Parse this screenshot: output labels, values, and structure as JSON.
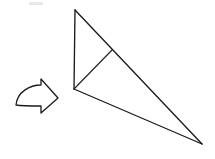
{
  "figure": {
    "background_color": "#ffffff",
    "stroke_color": "#1b1b1b",
    "caption": ""
  },
  "arrow": {
    "label": "fold-direction-arrow",
    "direction": "right",
    "style": "curved outline arrow",
    "fill_color": "#ffffff",
    "outline_color": "#1b1b1b",
    "tip_x": 58,
    "tip_y": 98,
    "path": "M 16 105 C 17 92, 30 85, 41 85 L 41 79 L 58 98 L 41 113 L 41 106 C 31 106, 22 106, 16 105 Z"
  },
  "shape": {
    "label": "folded-paper-triangle",
    "vertices": {
      "apex_top": {
        "x": 75,
        "y": 10
      },
      "left_corner": {
        "x": 74,
        "y": 89
      },
      "right_corner": {
        "x": 202,
        "y": 144
      },
      "crease_junction": {
        "x": 112,
        "y": 50
      }
    },
    "edges": [
      {
        "name": "left-vertical-edge",
        "from": "apex_top",
        "to": "left_corner",
        "path": "M 75 10 L 74 89"
      },
      {
        "name": "upper-hypotenuse-edge",
        "from": "apex_top",
        "to": "right_corner",
        "path": "M 75 10 L 202 144"
      },
      {
        "name": "lower-base-edge",
        "from": "left_corner",
        "to": "right_corner",
        "path": "M 74 89 L 202 144"
      },
      {
        "name": "fold-crease",
        "from": "left_corner",
        "to": "crease_junction",
        "path": "M 74 89 L 112 50"
      }
    ]
  },
  "artifacts": {
    "top_smudge": {
      "label": "scan-smudge",
      "x": 29,
      "y": 2,
      "width": 14,
      "height": 3,
      "color": "#e9e9e9"
    }
  }
}
